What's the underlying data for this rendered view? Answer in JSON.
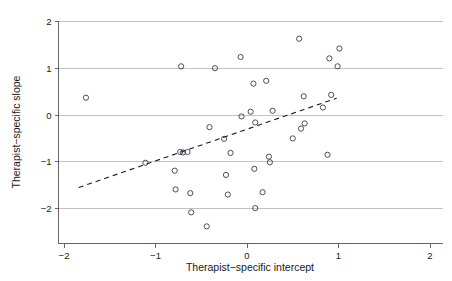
{
  "figure": {
    "background_color": "#ffffff",
    "marker_color": "#3a3a4a",
    "grid_color": "#b4b4b4",
    "axis_color": "#555555",
    "fitline_color": "#1a1a1a"
  },
  "chart_data": {
    "type": "scatter",
    "title": "",
    "xlabel": "Therapist−specific intercept",
    "ylabel": "Therapist−specific slope",
    "xlim": [
      -2.2,
      2.2
    ],
    "ylim": [
      -2.55,
      2.15
    ],
    "xticks": [
      -2,
      -1,
      0,
      1,
      2
    ],
    "xticklabels": [
      "−2",
      "−1",
      "0",
      "1",
      "2"
    ],
    "yticks": [
      -2,
      -1,
      0,
      1,
      2
    ],
    "yticklabels": [
      "−2",
      "−1",
      "0",
      "1",
      "2"
    ],
    "grid": "horizontal",
    "legend": "none",
    "points": [
      {
        "x": -1.76,
        "y": 0.37
      },
      {
        "x": -1.11,
        "y": -1.02
      },
      {
        "x": -0.72,
        "y": 1.04
      },
      {
        "x": -0.73,
        "y": -0.79
      },
      {
        "x": -0.7,
        "y": -0.8
      },
      {
        "x": -0.65,
        "y": -0.79
      },
      {
        "x": -0.79,
        "y": -1.19
      },
      {
        "x": -0.78,
        "y": -1.59
      },
      {
        "x": -0.62,
        "y": -1.67
      },
      {
        "x": -0.61,
        "y": -2.08
      },
      {
        "x": -0.44,
        "y": -2.38
      },
      {
        "x": -0.41,
        "y": -0.26
      },
      {
        "x": -0.35,
        "y": 1.0
      },
      {
        "x": -0.25,
        "y": -0.51
      },
      {
        "x": -0.23,
        "y": -1.28
      },
      {
        "x": -0.21,
        "y": -1.7
      },
      {
        "x": -0.18,
        "y": -0.81
      },
      {
        "x": -0.07,
        "y": 1.24
      },
      {
        "x": -0.06,
        "y": -0.03
      },
      {
        "x": 0.04,
        "y": 0.07
      },
      {
        "x": 0.07,
        "y": 0.67
      },
      {
        "x": 0.09,
        "y": -0.16
      },
      {
        "x": 0.08,
        "y": -1.15
      },
      {
        "x": 0.09,
        "y": -1.99
      },
      {
        "x": 0.17,
        "y": -1.65
      },
      {
        "x": 0.21,
        "y": 0.73
      },
      {
        "x": 0.24,
        "y": -0.89
      },
      {
        "x": 0.25,
        "y": -1.01
      },
      {
        "x": 0.28,
        "y": 0.09
      },
      {
        "x": 0.5,
        "y": -0.5
      },
      {
        "x": 0.57,
        "y": 1.63
      },
      {
        "x": 0.59,
        "y": -0.29
      },
      {
        "x": 0.62,
        "y": 0.4
      },
      {
        "x": 0.63,
        "y": -0.18
      },
      {
        "x": 0.83,
        "y": 0.16
      },
      {
        "x": 0.88,
        "y": -0.85
      },
      {
        "x": 0.9,
        "y": 1.21
      },
      {
        "x": 0.92,
        "y": 0.43
      },
      {
        "x": 0.99,
        "y": 1.04
      },
      {
        "x": 1.01,
        "y": 1.42
      }
    ],
    "fit_line": {
      "style": "dashed",
      "x_start": -1.84,
      "y_start": -1.55,
      "x_end": 0.98,
      "y_end": 0.36
    }
  }
}
